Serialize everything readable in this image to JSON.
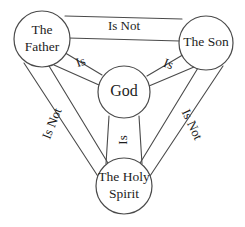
{
  "diagram": {
    "type": "venn-shield-diagram",
    "colors": {
      "background": "#ffffff",
      "stroke": "#4a4a4a",
      "text": "#1d1d1d"
    },
    "nodes": [
      {
        "id": "father",
        "label_line1": "The",
        "label_line2": "Father",
        "cx": 42,
        "cy": 39,
        "r": 28
      },
      {
        "id": "son",
        "label_line1": "The Son",
        "label_line2": "",
        "cx": 206,
        "cy": 43,
        "r": 27
      },
      {
        "id": "god",
        "label_line1": "God",
        "label_line2": "",
        "cx": 124,
        "cy": 92,
        "r": 26
      },
      {
        "id": "spirit",
        "label_line1": "The Holy",
        "label_line2": "Spirit",
        "cx": 124,
        "cy": 186,
        "r": 28
      }
    ],
    "relations": [
      {
        "id": "father-son",
        "label": "Is Not",
        "from": "father",
        "to": "son",
        "rotation": 0,
        "x": 124,
        "y": 27
      },
      {
        "id": "father-spirit",
        "label": "Is Not",
        "from": "father",
        "to": "spirit",
        "rotation": -68,
        "x": 53,
        "y": 124
      },
      {
        "id": "son-spirit",
        "label": "Is Not",
        "from": "son",
        "to": "spirit",
        "rotation": 65,
        "x": 191,
        "y": 125
      },
      {
        "id": "father-god",
        "label": "Is",
        "from": "father",
        "to": "god",
        "rotation": -19,
        "x": 81,
        "y": 63
      },
      {
        "id": "son-god",
        "label": "Is",
        "from": "son",
        "to": "god",
        "rotation": 20,
        "x": 168,
        "y": 65
      },
      {
        "id": "god-spirit",
        "label": "Is",
        "from": "god",
        "to": "spirit",
        "rotation": -90,
        "x": 124,
        "y": 140
      }
    ]
  }
}
